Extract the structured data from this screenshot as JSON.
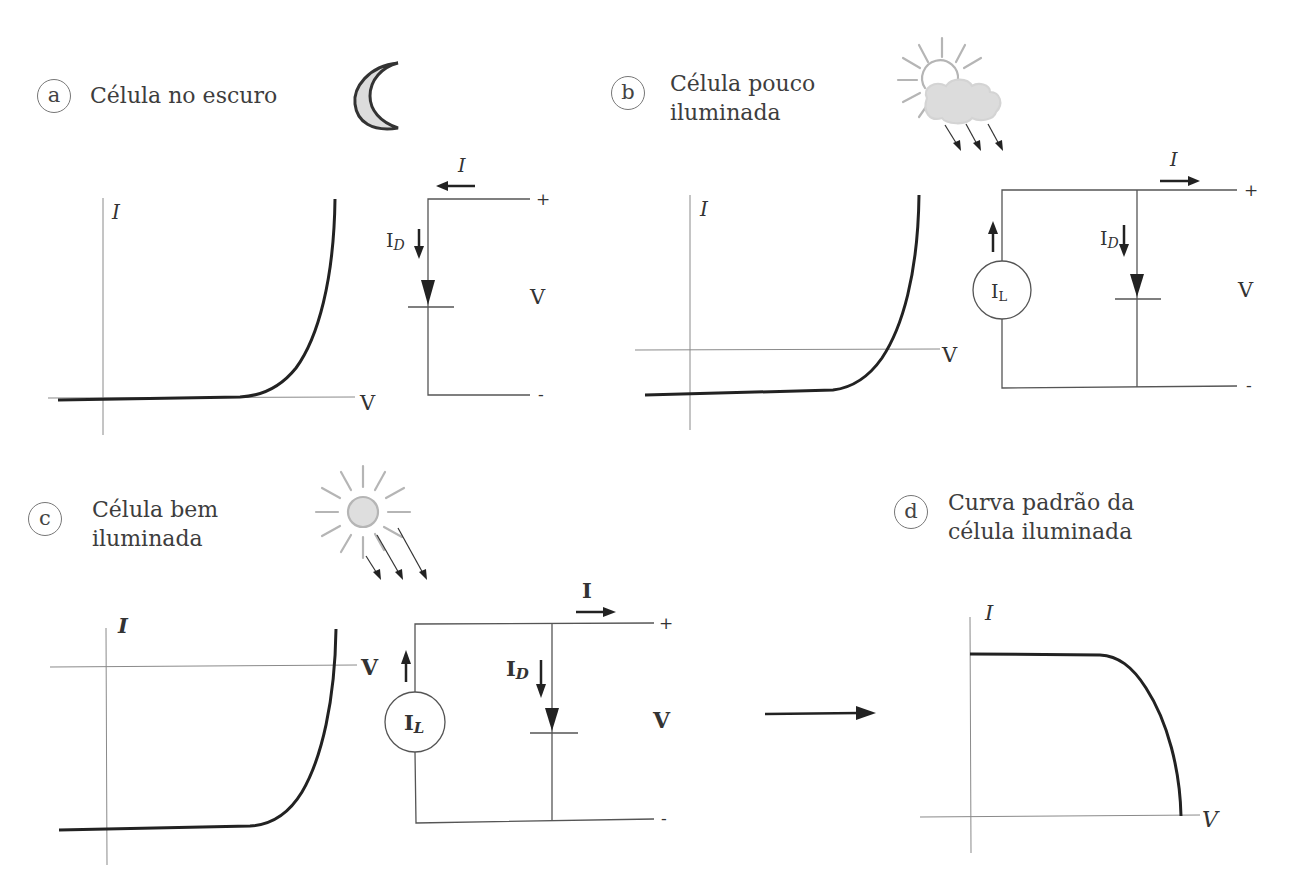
{
  "figure": {
    "panels": [
      {
        "id": "a",
        "badge": "a",
        "caption_lines": [
          "Célula no escuro"
        ],
        "icon": "moon-icon",
        "graph": {
          "x_label": "V",
          "y_label": "I"
        },
        "circuit": {
          "current_label": "I",
          "diode_current_label": "I",
          "diode_current_sub": "D",
          "voltage_label": "V",
          "plus": "+",
          "minus": "-"
        }
      },
      {
        "id": "b",
        "badge": "b",
        "caption_lines": [
          "Célula pouco",
          "iluminada"
        ],
        "icon": "sun-behind-cloud-icon",
        "graph": {
          "x_label": "V",
          "y_label": "I"
        },
        "circuit": {
          "current_label": "I",
          "source_label": "I",
          "source_sub": "L",
          "diode_current_label": "I",
          "diode_current_sub": "D",
          "voltage_label": "V",
          "plus": "+",
          "minus": "-"
        }
      },
      {
        "id": "c",
        "badge": "c",
        "caption_lines": [
          "Célula bem",
          "iluminada"
        ],
        "icon": "bright-sun-icon",
        "graph": {
          "x_label": "V",
          "y_label": "I"
        },
        "circuit": {
          "current_label": "I",
          "source_label": "I",
          "source_sub": "L",
          "diode_current_label": "I",
          "diode_current_sub": "D",
          "voltage_label": "V",
          "plus": "+",
          "minus": "-"
        }
      },
      {
        "id": "d",
        "badge": "d",
        "caption_lines": [
          "Curva padrão da",
          "célula iluminada"
        ],
        "graph": {
          "x_label": "V",
          "y_label": "I"
        }
      }
    ]
  },
  "colors": {
    "ink": "#222222",
    "axis": "#8a8a8a",
    "wire": "#555555",
    "icon_gray": "#b5b5b5",
    "icon_fill": "#d9d9d9"
  }
}
